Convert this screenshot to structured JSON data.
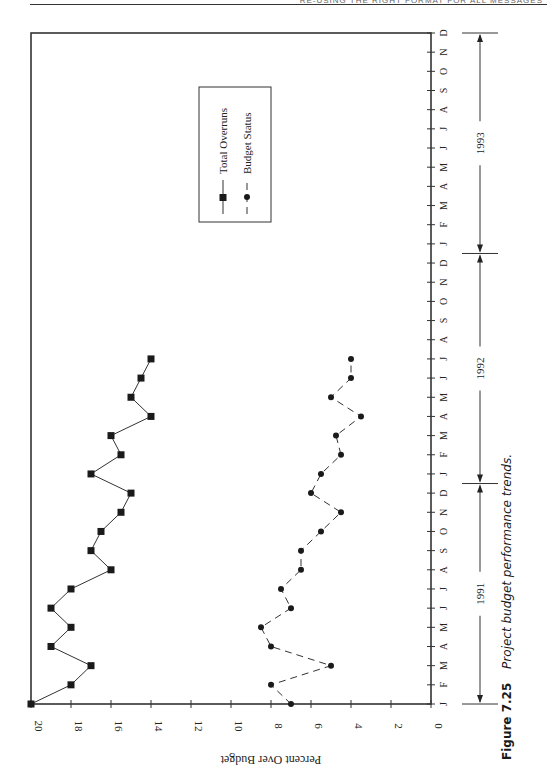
{
  "page": {
    "header_text": "RE-USING THE RIGHT FORMAT FOR ALL MESSAGES"
  },
  "caption": {
    "figure_label": "Figure 7.25",
    "title": "Project budget performance trends."
  },
  "chart_data": {
    "type": "line",
    "title": "Project budget performance trends.",
    "orientation": "rotated-90",
    "xlabel": "",
    "ylabel": "Percent Over Budget",
    "ylim": [
      0,
      20
    ],
    "yticks": [
      0,
      2,
      4,
      6,
      8,
      10,
      12,
      14,
      16,
      18,
      20
    ],
    "x_tick_labels": [
      "J",
      "F",
      "M",
      "A",
      "M",
      "J",
      "J",
      "A",
      "S",
      "O",
      "N",
      "D",
      "J",
      "F",
      "M",
      "A",
      "M",
      "J",
      "J",
      "A",
      "S",
      "O",
      "N",
      "D",
      "J",
      "F",
      "M",
      "A",
      "M",
      "J",
      "J",
      "A",
      "S",
      "O",
      "N",
      "D"
    ],
    "year_spans": [
      {
        "label": "1991",
        "start": 0,
        "end": 11
      },
      {
        "label": "1992",
        "start": 12,
        "end": 23
      },
      {
        "label": "1993",
        "start": 24,
        "end": 35
      }
    ],
    "grid": false,
    "legend": {
      "position": "upper-right (inside plot)",
      "entries": [
        "Total Overruns",
        "Budget Status"
      ]
    },
    "series": [
      {
        "name": "Total Overruns",
        "marker": "square",
        "line": "solid",
        "values": [
          20,
          18,
          17,
          19,
          18,
          19,
          18,
          16,
          17,
          16.5,
          15.5,
          15,
          17,
          15.5,
          16,
          14,
          15,
          14.5,
          14
        ]
      },
      {
        "name": "Budget Status",
        "marker": "circle",
        "line": "dashed",
        "values": [
          7,
          8,
          5,
          8,
          8.5,
          7,
          7.5,
          6.5,
          6.5,
          5.5,
          4.5,
          6,
          5.5,
          4.5,
          4.75,
          3.5,
          5,
          4,
          4
        ]
      }
    ]
  }
}
